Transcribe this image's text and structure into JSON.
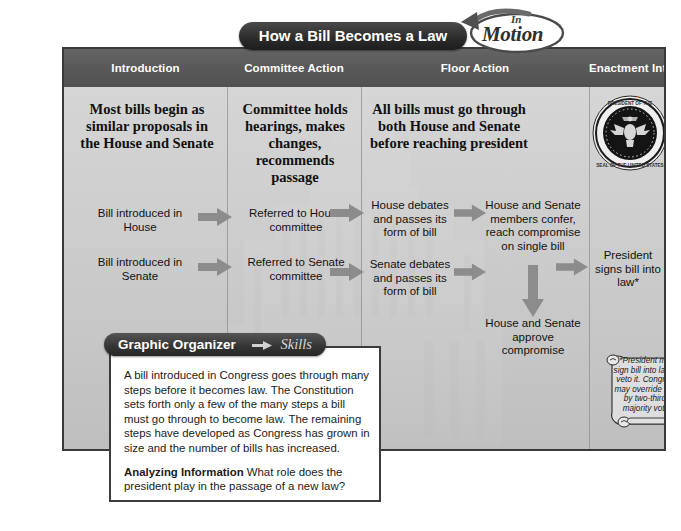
{
  "title_pill": "How a Bill Becomes a Law",
  "logo": {
    "line1": "In",
    "line2": "Motion"
  },
  "columns": [
    {
      "header": "Introduction"
    },
    {
      "header": "Committee Action"
    },
    {
      "header": "Floor Action"
    },
    {
      "header": "Enactment Into Law"
    }
  ],
  "leads": {
    "introduction": "Most bills begin as similar proposals in the House and Senate",
    "committee": "Committee holds hearings, makes changes, recommends passage",
    "floor": "All bills must go through both House and Senate before reaching president"
  },
  "steps": {
    "bill_house": "Bill introduced in House",
    "bill_senate": "Bill introduced in Senate",
    "referred_house": "Referred to House committee",
    "referred_senate": "Referred to Senate committee",
    "house_debates": "House debates and passes its form of bill",
    "senate_debates": "Senate debates and passes its form of bill",
    "confer": "House and Senate members confer, reach compromise on single bill",
    "approve": "House and Senate approve compromise",
    "president_signs": "President signs bill into law*"
  },
  "scroll_note": "*President may sign bill into law or veto it. Congress may override veto by two-thirds majority vote.",
  "graphic_organizer": {
    "title": "Graphic Organizer",
    "skills": "Skills",
    "paragraph": "A bill introduced in Congress goes through many steps before it becomes law. The Constitution sets forth only a few of the many steps a bill must go through to become law. The remaining steps have developed as Congress has grown in size and the number of bills has increased.",
    "question_label": "Analyzing Information",
    "question": "What role does the president play in the passage of a new law?"
  },
  "icons": {
    "presidential_seal": "presidential-seal-icon",
    "capitol_dome": "capitol-dome-watermark-icon",
    "in_motion": "in-motion-logo-icon"
  },
  "colors": {
    "header_bar": "#595959",
    "panel_bg": "#cfcfcf",
    "frame_border": "#3a3a3a",
    "arrow_gray": "#8a8a8a",
    "pill_dark": "#2b2b2b"
  }
}
